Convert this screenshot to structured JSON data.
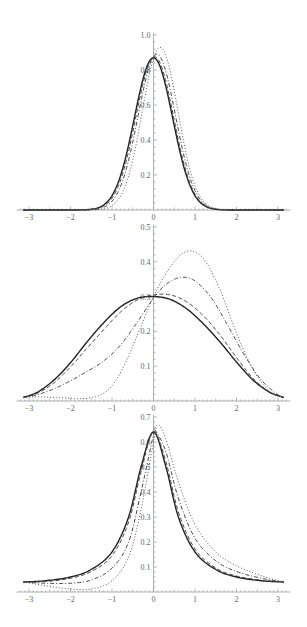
{
  "chart_data": [
    {
      "type": "line",
      "title": "",
      "xlabel": "",
      "ylabel": "",
      "xlim": [
        -3.1416,
        3.1416
      ],
      "ylim": [
        0,
        1.0
      ],
      "x_ticks": [
        "-3",
        "-2",
        "-1",
        "0",
        "1",
        "2",
        "3"
      ],
      "y_ticks": [
        "0.2",
        "0.4",
        "0.6",
        "0.8",
        "1.0"
      ],
      "grid": false,
      "legend": "none",
      "series": [
        {
          "name": "solid",
          "style": "solid",
          "peak_x": 0.0,
          "peak_y": 0.87,
          "width": 0.46,
          "skew": 0.0
        },
        {
          "name": "dashed",
          "style": "dashed",
          "peak_x": 0.03,
          "peak_y": 0.875,
          "width": 0.455,
          "skew": 0.0
        },
        {
          "name": "dashdot",
          "style": "dashdot",
          "peak_x": 0.08,
          "peak_y": 0.89,
          "width": 0.45,
          "skew": 0.0
        },
        {
          "name": "dotted",
          "style": "dotted",
          "peak_x": 0.16,
          "peak_y": 0.93,
          "width": 0.43,
          "skew": 0.0
        }
      ],
      "frame": {
        "x0": 29,
        "x3": 278,
        "y0": 210,
        "y1": 35
      }
    },
    {
      "type": "line",
      "title": "",
      "xlabel": "",
      "ylabel": "",
      "xlim": [
        -3.1416,
        3.1416
      ],
      "ylim": [
        0,
        0.5
      ],
      "x_ticks": [
        "-3",
        "-2",
        "-1",
        "0",
        "1",
        "2",
        "3"
      ],
      "y_ticks": [
        "0.1",
        "0.2",
        "0.3",
        "0.4",
        "0.5"
      ],
      "grid": false,
      "legend": "none",
      "series": [
        {
          "name": "solid",
          "style": "solid",
          "x": [
            -3.14,
            -2.8,
            -2.4,
            -2.0,
            -1.6,
            -1.2,
            -0.8,
            -0.4,
            0.0,
            0.4,
            0.8,
            1.2,
            1.6,
            2.0,
            2.4,
            2.8,
            3.14
          ],
          "y": [
            0.01,
            0.025,
            0.06,
            0.11,
            0.17,
            0.225,
            0.27,
            0.295,
            0.3,
            0.292,
            0.265,
            0.222,
            0.17,
            0.112,
            0.06,
            0.025,
            0.01
          ]
        },
        {
          "name": "dashed",
          "style": "dashed",
          "x": [
            -3.14,
            -2.8,
            -2.4,
            -2.0,
            -1.6,
            -1.2,
            -0.8,
            -0.4,
            0.0,
            0.4,
            0.8,
            1.2,
            1.6,
            2.0,
            2.4,
            2.8,
            3.14
          ],
          "y": [
            0.01,
            0.022,
            0.052,
            0.098,
            0.152,
            0.205,
            0.255,
            0.29,
            0.305,
            0.305,
            0.285,
            0.245,
            0.19,
            0.125,
            0.065,
            0.026,
            0.01
          ]
        },
        {
          "name": "dashdot",
          "style": "dashdot",
          "x": [
            -3.14,
            -2.8,
            -2.4,
            -2.0,
            -1.6,
            -1.2,
            -0.8,
            -0.4,
            0.0,
            0.3,
            0.65,
            1.0,
            1.4,
            1.8,
            2.2,
            2.6,
            3.0,
            3.14
          ],
          "y": [
            0.01,
            0.018,
            0.035,
            0.058,
            0.085,
            0.115,
            0.16,
            0.225,
            0.295,
            0.335,
            0.355,
            0.345,
            0.295,
            0.215,
            0.13,
            0.06,
            0.018,
            0.01
          ]
        },
        {
          "name": "dotted",
          "style": "dotted",
          "x": [
            -3.14,
            -2.8,
            -2.4,
            -2.0,
            -1.6,
            -1.2,
            -0.9,
            -0.6,
            -0.3,
            0.0,
            0.4,
            0.8,
            1.2,
            1.6,
            2.0,
            2.4,
            2.8,
            3.14
          ],
          "y": [
            0.01,
            0.012,
            0.01,
            0.008,
            0.008,
            0.022,
            0.06,
            0.13,
            0.215,
            0.3,
            0.385,
            0.43,
            0.41,
            0.32,
            0.195,
            0.09,
            0.028,
            0.01
          ]
        }
      ],
      "frame": {
        "x0": 29,
        "x3": 278,
        "y0": 401,
        "y1": 227
      }
    },
    {
      "type": "line",
      "title": "",
      "xlabel": "",
      "ylabel": "",
      "xlim": [
        -3.1416,
        3.1416
      ],
      "ylim": [
        0,
        0.7
      ],
      "x_ticks": [
        "-3",
        "-2",
        "-1",
        "0",
        "1",
        "2",
        "3"
      ],
      "y_ticks": [
        "0.1",
        "0.2",
        "0.3",
        "0.4",
        "0.5",
        "0.6",
        "0.7"
      ],
      "grid": false,
      "legend": "none",
      "series": [
        {
          "name": "solid",
          "style": "solid",
          "x": [
            -3.14,
            -2.6,
            -2.0,
            -1.5,
            -1.0,
            -0.6,
            -0.3,
            0.0,
            0.3,
            0.6,
            1.0,
            1.5,
            2.0,
            2.6,
            3.14
          ],
          "y": [
            0.04,
            0.045,
            0.06,
            0.09,
            0.16,
            0.3,
            0.5,
            0.64,
            0.5,
            0.3,
            0.16,
            0.09,
            0.06,
            0.045,
            0.04
          ]
        },
        {
          "name": "dashed",
          "style": "dashed",
          "x": [
            -3.14,
            -2.6,
            -2.0,
            -1.5,
            -1.0,
            -0.6,
            -0.3,
            0.0,
            0.3,
            0.6,
            1.0,
            1.5,
            2.0,
            2.6,
            3.14
          ],
          "y": [
            0.04,
            0.042,
            0.055,
            0.082,
            0.145,
            0.28,
            0.48,
            0.64,
            0.52,
            0.32,
            0.172,
            0.096,
            0.064,
            0.047,
            0.04
          ]
        },
        {
          "name": "dashdot",
          "style": "dashdot",
          "x": [
            -3.14,
            -2.6,
            -2.0,
            -1.5,
            -1.0,
            -0.6,
            -0.3,
            0.0,
            0.05,
            0.3,
            0.6,
            1.0,
            1.5,
            2.0,
            2.6,
            3.14
          ],
          "y": [
            0.04,
            0.035,
            0.035,
            0.048,
            0.095,
            0.2,
            0.4,
            0.63,
            0.645,
            0.56,
            0.375,
            0.215,
            0.125,
            0.082,
            0.055,
            0.04
          ]
        },
        {
          "name": "dotted",
          "style": "dotted",
          "x": [
            -3.14,
            -2.6,
            -2.0,
            -1.5,
            -1.0,
            -0.6,
            -0.3,
            0.0,
            0.1,
            0.3,
            0.6,
            1.0,
            1.5,
            2.0,
            2.6,
            3.14
          ],
          "y": [
            0.04,
            0.025,
            0.012,
            0.012,
            0.045,
            0.14,
            0.33,
            0.6,
            0.67,
            0.61,
            0.44,
            0.27,
            0.16,
            0.105,
            0.065,
            0.04
          ]
        }
      ],
      "frame": {
        "x0": 29,
        "x3": 278,
        "y0": 592,
        "y1": 417
      }
    }
  ]
}
